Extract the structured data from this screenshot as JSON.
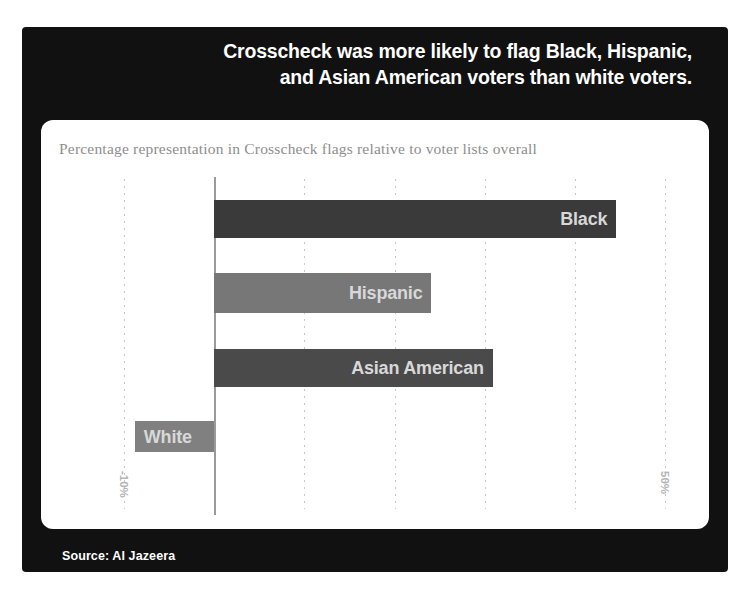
{
  "headline": {
    "line1": "Crosscheck was more likely to flag Black, Hispanic,",
    "line2": "and Asian American voters than white voters."
  },
  "subtitle": "Percentage representation in Crosscheck flags relative to voter lists overall",
  "footer": {
    "source": "Source: Al Jazeera"
  },
  "colors": {
    "card_background": "#111111",
    "panel_background": "#ffffff",
    "headline_text": "#ffffff",
    "subtitle_text": "#8e8e8e",
    "bar_label_text": "#d8d8d8",
    "axis_line": "#9a9a9a",
    "gridline": "#c8c8c8",
    "tick_text": "#b4b4b4",
    "bar_black": "#3a3a3a",
    "bar_hispanic": "#777777",
    "bar_asian_american": "#4a4a4a",
    "bar_white": "#808080"
  },
  "chart_data": {
    "type": "bar",
    "orientation": "horizontal",
    "title": "Crosscheck was more likely to flag Black, Hispanic, and Asian American voters than white voters.",
    "subtitle": "Percentage representation in Crosscheck flags relative to voter lists overall",
    "xlabel": "",
    "ylabel": "",
    "xlim": [
      -10,
      50
    ],
    "grid": true,
    "legend": "none",
    "tick_labels": [
      "-10%",
      "50%"
    ],
    "categories": [
      "Black",
      "Hispanic",
      "Asian American",
      "White"
    ],
    "values": [
      44.6,
      24.1,
      30.9,
      -8.8
    ],
    "bars": [
      {
        "label": "Black",
        "value": 44.6,
        "color": "#3a3a3a",
        "label_side": "right"
      },
      {
        "label": "Hispanic",
        "value": 24.1,
        "color": "#777777",
        "label_side": "right"
      },
      {
        "label": "Asian American",
        "value": 30.9,
        "color": "#4a4a4a",
        "label_side": "right"
      },
      {
        "label": "White",
        "value": -8.8,
        "color": "#808080",
        "label_side": "left"
      }
    ]
  },
  "axis": {
    "left_tick": "-10%",
    "right_tick": "50%"
  }
}
